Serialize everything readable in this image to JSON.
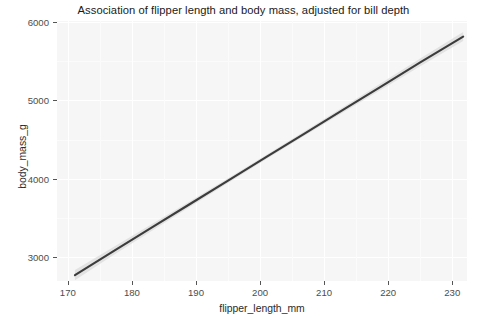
{
  "chart_data": {
    "type": "line",
    "title": "Association of flipper length and body mass, adjusted for bill depth",
    "xlabel": "flipper_length_mm",
    "ylabel": "body_mass_g",
    "xlim": [
      168.3,
      232.3
    ],
    "ylim": [
      2690,
      6016
    ],
    "grid": true,
    "legend": "none",
    "x_ticks": [
      170,
      180,
      190,
      200,
      210,
      220,
      230
    ],
    "x_tick_labels": [
      "170",
      "180",
      "190",
      "200",
      "210",
      "220",
      "230"
    ],
    "y_ticks": [
      3000,
      4000,
      5000,
      6000
    ],
    "y_tick_labels": [
      "3000",
      "4000",
      "5000",
      "6000"
    ],
    "series": [
      {
        "name": "fitted linear trend",
        "style": "line",
        "color": "#3c3c3c",
        "x": [
          171.1,
          177.0,
          183.0,
          189.0,
          195.0,
          201.0,
          207.0,
          213.0,
          219.0,
          225.0,
          231.7
        ],
        "y": [
          2765,
          3067,
          3369,
          3672,
          3974,
          4277,
          4579,
          4882,
          5184,
          5487,
          5817
        ]
      },
      {
        "name": "confidence band",
        "style": "ribbon",
        "color": "#d9d9d9",
        "x": [
          171.1,
          177.0,
          183.0,
          189.0,
          195.0,
          201.0,
          207.0,
          213.0,
          219.0,
          225.0,
          231.7
        ],
        "ymin": [
          2700,
          3015,
          3325,
          3636,
          3944,
          4250,
          4550,
          4848,
          5143,
          5438,
          5760
        ],
        "ymax": [
          2830,
          3119,
          3413,
          3708,
          4004,
          4304,
          4608,
          4916,
          5225,
          5536,
          5874
        ]
      }
    ]
  },
  "axes": {
    "x_title": "flipper_length_mm",
    "y_title": "body_mass_g"
  }
}
